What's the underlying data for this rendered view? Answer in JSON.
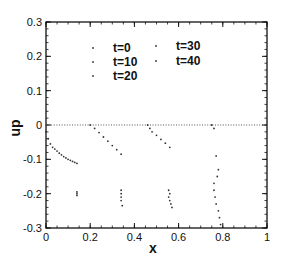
{
  "chart_data": {
    "type": "scatter",
    "title": "",
    "xlabel": "x",
    "ylabel": "up",
    "xlim": [
      0,
      1
    ],
    "ylim": [
      -0.3,
      0.3
    ],
    "xticks": [
      "0",
      "0.2",
      "0.4",
      "0.6",
      "0.8",
      "1"
    ],
    "yticks": [
      "0.3",
      "0.2",
      "0.1",
      "0",
      "-0.1",
      "-0.2",
      "-0.3"
    ],
    "grid": false,
    "legend_position": "upper center",
    "series": [
      {
        "name": "t=0",
        "points": [
          [
            0.0,
            -0.02
          ],
          [
            0.01,
            -0.04
          ],
          [
            0.02,
            -0.055
          ],
          [
            0.03,
            -0.065
          ],
          [
            0.04,
            -0.07
          ],
          [
            0.05,
            -0.076
          ],
          [
            0.06,
            -0.082
          ],
          [
            0.07,
            -0.087
          ],
          [
            0.08,
            -0.092
          ],
          [
            0.09,
            -0.096
          ],
          [
            0.1,
            -0.1
          ],
          [
            0.11,
            -0.103
          ],
          [
            0.12,
            -0.106
          ],
          [
            0.13,
            -0.109
          ],
          [
            0.14,
            -0.112
          ]
        ]
      },
      {
        "name": "t=10",
        "points": [
          [
            0.2,
            0.0
          ],
          [
            0.22,
            -0.01
          ],
          [
            0.24,
            -0.022
          ],
          [
            0.26,
            -0.035
          ],
          [
            0.28,
            -0.047
          ],
          [
            0.3,
            -0.06
          ],
          [
            0.32,
            -0.072
          ],
          [
            0.34,
            -0.085
          ],
          [
            0.14,
            -0.195
          ],
          [
            0.14,
            -0.2
          ],
          [
            0.14,
            -0.205
          ]
        ]
      },
      {
        "name": "t=20",
        "points": [
          [
            0.46,
            0.0
          ],
          [
            0.47,
            -0.01
          ],
          [
            0.48,
            -0.02
          ],
          [
            0.5,
            -0.03
          ],
          [
            0.52,
            -0.042
          ],
          [
            0.54,
            -0.053
          ],
          [
            0.56,
            -0.065
          ],
          [
            0.34,
            -0.19
          ],
          [
            0.34,
            -0.2
          ],
          [
            0.34,
            -0.21
          ],
          [
            0.34,
            -0.22
          ],
          [
            0.345,
            -0.235
          ]
        ]
      },
      {
        "name": "t=30",
        "points": [
          [
            0.75,
            0.0
          ],
          [
            0.76,
            -0.01
          ],
          [
            0.555,
            -0.19
          ],
          [
            0.56,
            -0.2
          ],
          [
            0.555,
            -0.21
          ],
          [
            0.56,
            -0.22
          ],
          [
            0.565,
            -0.23
          ],
          [
            0.57,
            -0.24
          ]
        ]
      },
      {
        "name": "t=40",
        "points": [
          [
            0.77,
            -0.09
          ],
          [
            0.78,
            -0.13
          ],
          [
            0.775,
            -0.15
          ],
          [
            0.76,
            -0.17
          ],
          [
            0.76,
            -0.19
          ],
          [
            0.765,
            -0.21
          ],
          [
            0.77,
            -0.23
          ],
          [
            0.78,
            -0.25
          ],
          [
            0.785,
            -0.27
          ],
          [
            0.79,
            -0.29
          ]
        ]
      }
    ],
    "baseline": {
      "y": 0,
      "x_range": [
        0,
        1
      ],
      "style": "dotted"
    }
  }
}
